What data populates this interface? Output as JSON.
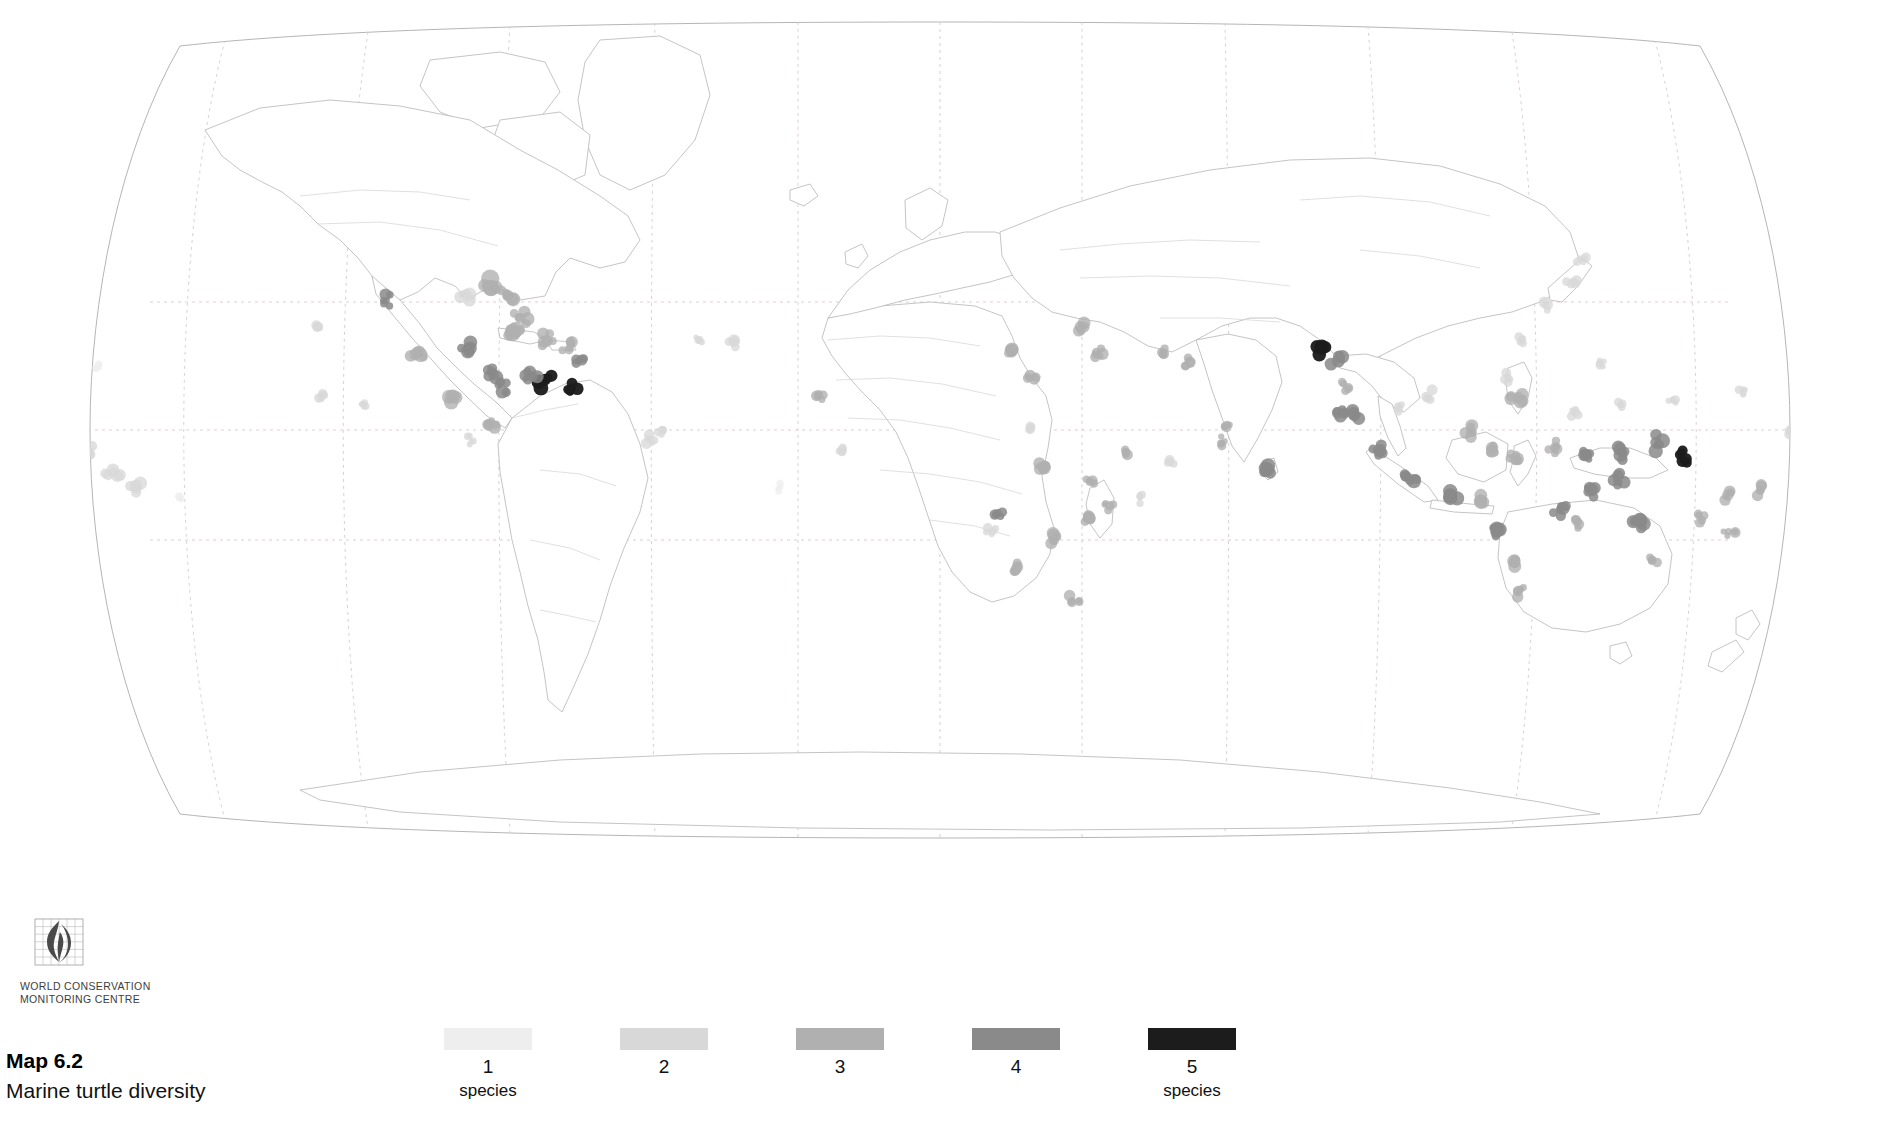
{
  "figure": {
    "caption_label": "Map 6.2",
    "caption_title": "Marine turtle diversity",
    "projection": "Robinson",
    "background_color": "#ffffff",
    "coastline_color": "#b9b9b9",
    "border_color": "#cfcfcf",
    "graticule_color": "#d9c9cf"
  },
  "logo": {
    "name": "wcmc-logo",
    "line1": "WORLD CONSERVATION",
    "line2": "MONITORING CENTRE",
    "mark_color": "#4a4a4a",
    "grid_color": "#9b9b9b"
  },
  "legend": {
    "title": "",
    "unit": "species",
    "items": [
      {
        "label": "1",
        "unit": "species",
        "color": "#eeeeee",
        "show_unit": true
      },
      {
        "label": "2",
        "unit": "species",
        "color": "#d8d8d8",
        "show_unit": false
      },
      {
        "label": "3",
        "unit": "species",
        "color": "#b0b0b0",
        "show_unit": false
      },
      {
        "label": "4",
        "unit": "species",
        "color": "#8a8a8a",
        "show_unit": false
      },
      {
        "label": "5",
        "unit": "species",
        "color": "#1c1c1c",
        "show_unit": true
      }
    ]
  },
  "chart_data": {
    "type": "map",
    "title": "Marine turtle diversity",
    "subtitle": "Map 6.2",
    "projection": "Robinson",
    "value_label": "species",
    "classes": [
      {
        "value": 1,
        "color": "#eeeeee"
      },
      {
        "value": 2,
        "color": "#d8d8d8"
      },
      {
        "value": 3,
        "color": "#b0b0b0"
      },
      {
        "value": 4,
        "color": "#8a8a8a"
      },
      {
        "value": 5,
        "color": "#1c1c1c"
      }
    ],
    "graticule": {
      "meridian_spacing_deg": 30,
      "parallels": [
        "Tropic of Cancer",
        "Equator",
        "Tropic of Capricorn"
      ],
      "style": "dotted"
    },
    "regions": [
      {
        "name": "Hawaiian Islands",
        "x": 113,
        "y": 472,
        "r": 9,
        "value": 2
      },
      {
        "name": "Hawaii-west",
        "x": 90,
        "y": 452,
        "r": 7,
        "value": 2
      },
      {
        "name": "Hawaii-east",
        "x": 135,
        "y": 487,
        "r": 8,
        "value": 2
      },
      {
        "name": "Northwest Hawaiian chain",
        "x": 97,
        "y": 368,
        "r": 5,
        "value": 1
      },
      {
        "name": "Line Islands",
        "x": 64,
        "y": 438,
        "r": 6,
        "value": 2
      },
      {
        "name": "Johnston Atoll",
        "x": 55,
        "y": 430,
        "r": 5,
        "value": 1
      },
      {
        "name": "Central Pacific atolls",
        "x": 180,
        "y": 496,
        "r": 5,
        "value": 1
      },
      {
        "name": "Baja California Pacific",
        "x": 318,
        "y": 326,
        "r": 6,
        "value": 2
      },
      {
        "name": "Gulf of California",
        "x": 385,
        "y": 300,
        "r": 8,
        "value": 4
      },
      {
        "name": "Revillagigedo",
        "x": 323,
        "y": 395,
        "r": 6,
        "value": 2
      },
      {
        "name": "Clipperton",
        "x": 362,
        "y": 404,
        "r": 5,
        "value": 2
      },
      {
        "name": "Mexican Pacific coast",
        "x": 418,
        "y": 355,
        "r": 9,
        "value": 3
      },
      {
        "name": "Central American Pacific",
        "x": 452,
        "y": 395,
        "r": 9,
        "value": 3
      },
      {
        "name": "Panama Pacific",
        "x": 495,
        "y": 425,
        "r": 8,
        "value": 3
      },
      {
        "name": "Gulf of Mexico - Texas",
        "x": 468,
        "y": 295,
        "r": 9,
        "value": 2
      },
      {
        "name": "Florida - Gulf",
        "x": 492,
        "y": 288,
        "r": 11,
        "value": 3
      },
      {
        "name": "Florida Atlantic",
        "x": 508,
        "y": 295,
        "r": 9,
        "value": 3
      },
      {
        "name": "Bahamas",
        "x": 520,
        "y": 318,
        "r": 9,
        "value": 3
      },
      {
        "name": "Cuba",
        "x": 512,
        "y": 332,
        "r": 10,
        "value": 3
      },
      {
        "name": "Yucatan / Belize",
        "x": 470,
        "y": 348,
        "r": 9,
        "value": 4
      },
      {
        "name": "Honduras / Nicaragua Caribbean",
        "x": 492,
        "y": 372,
        "r": 9,
        "value": 4
      },
      {
        "name": "Costa Rica Caribbean",
        "x": 502,
        "y": 386,
        "r": 8,
        "value": 4
      },
      {
        "name": "Hispaniola",
        "x": 545,
        "y": 340,
        "r": 9,
        "value": 3
      },
      {
        "name": "Puerto Rico / Virgin Is.",
        "x": 566,
        "y": 344,
        "r": 8,
        "value": 3
      },
      {
        "name": "Lesser Antilles",
        "x": 580,
        "y": 360,
        "r": 7,
        "value": 4
      },
      {
        "name": "Trinidad / Venezuela",
        "x": 572,
        "y": 385,
        "r": 8,
        "value": 5
      },
      {
        "name": "Guianas",
        "x": 545,
        "y": 381,
        "r": 9,
        "value": 5
      },
      {
        "name": "Colombia Caribbean",
        "x": 530,
        "y": 378,
        "r": 8,
        "value": 4
      },
      {
        "name": "Brazil northeast",
        "x": 648,
        "y": 441,
        "r": 7,
        "value": 2
      },
      {
        "name": "Fernando de Noronha",
        "x": 660,
        "y": 432,
        "r": 5,
        "value": 2
      },
      {
        "name": "Cape Verde",
        "x": 735,
        "y": 341,
        "r": 7,
        "value": 2
      },
      {
        "name": "Senegal / West Africa",
        "x": 818,
        "y": 396,
        "r": 7,
        "value": 3
      },
      {
        "name": "Guinea coast",
        "x": 843,
        "y": 452,
        "r": 6,
        "value": 2
      },
      {
        "name": "Gulf of Guinea / Bioko",
        "x": 998,
        "y": 513,
        "r": 7,
        "value": 4
      },
      {
        "name": "Sao Tome",
        "x": 991,
        "y": 530,
        "r": 6,
        "value": 2
      },
      {
        "name": "Angola / Namibia coast",
        "x": 1017,
        "y": 566,
        "r": 8,
        "value": 3
      },
      {
        "name": "South Africa east",
        "x": 1075,
        "y": 598,
        "r": 7,
        "value": 3
      },
      {
        "name": "Mozambique coast",
        "x": 1054,
        "y": 540,
        "r": 8,
        "value": 3
      },
      {
        "name": "Madagascar west",
        "x": 1089,
        "y": 520,
        "r": 8,
        "value": 3
      },
      {
        "name": "Madagascar east",
        "x": 1110,
        "y": 505,
        "r": 7,
        "value": 3
      },
      {
        "name": "Comoros / Mayotte",
        "x": 1092,
        "y": 480,
        "r": 7,
        "value": 3
      },
      {
        "name": "Seychelles",
        "x": 1126,
        "y": 455,
        "r": 7,
        "value": 3
      },
      {
        "name": "Mascarenes / Reunion",
        "x": 1140,
        "y": 498,
        "r": 6,
        "value": 2
      },
      {
        "name": "Chagos",
        "x": 1170,
        "y": 460,
        "r": 6,
        "value": 2
      },
      {
        "name": "Kenya / Tanzania",
        "x": 1045,
        "y": 466,
        "r": 8,
        "value": 3
      },
      {
        "name": "Somalia",
        "x": 1030,
        "y": 430,
        "r": 6,
        "value": 2
      },
      {
        "name": "Red Sea",
        "x": 1012,
        "y": 350,
        "r": 8,
        "value": 3
      },
      {
        "name": "Gulf of Aden",
        "x": 1030,
        "y": 378,
        "r": 7,
        "value": 3
      },
      {
        "name": "Arabian Gulf",
        "x": 1082,
        "y": 330,
        "r": 8,
        "value": 3
      },
      {
        "name": "Oman",
        "x": 1098,
        "y": 353,
        "r": 8,
        "value": 3
      },
      {
        "name": "Pakistan / NW India",
        "x": 1165,
        "y": 352,
        "r": 7,
        "value": 3
      },
      {
        "name": "Gujarat",
        "x": 1190,
        "y": 362,
        "r": 7,
        "value": 3
      },
      {
        "name": "Maldives",
        "x": 1222,
        "y": 443,
        "r": 7,
        "value": 3
      },
      {
        "name": "Lakshadweep",
        "x": 1228,
        "y": 426,
        "r": 6,
        "value": 3
      },
      {
        "name": "Sri Lanka",
        "x": 1268,
        "y": 470,
        "r": 9,
        "value": 4
      },
      {
        "name": "Andaman & Nicobar",
        "x": 1338,
        "y": 412,
        "r": 8,
        "value": 4
      },
      {
        "name": "Orissa / Bay of Bengal",
        "x": 1322,
        "y": 347,
        "r": 9,
        "value": 5
      },
      {
        "name": "Bangladesh / Myanmar",
        "x": 1337,
        "y": 360,
        "r": 8,
        "value": 4
      },
      {
        "name": "Myanmar coast",
        "x": 1345,
        "y": 385,
        "r": 7,
        "value": 3
      },
      {
        "name": "Thailand Andaman",
        "x": 1356,
        "y": 412,
        "r": 8,
        "value": 4
      },
      {
        "name": "Gulf of Thailand",
        "x": 1399,
        "y": 406,
        "r": 7,
        "value": 2
      },
      {
        "name": "Vietnam",
        "x": 1430,
        "y": 395,
        "r": 7,
        "value": 2
      },
      {
        "name": "Sumatra west",
        "x": 1380,
        "y": 452,
        "r": 9,
        "value": 4
      },
      {
        "name": "Sumatra south",
        "x": 1410,
        "y": 480,
        "r": 9,
        "value": 4
      },
      {
        "name": "Java",
        "x": 1450,
        "y": 497,
        "r": 9,
        "value": 4
      },
      {
        "name": "Bali / Lesser Sunda",
        "x": 1480,
        "y": 500,
        "r": 8,
        "value": 3
      },
      {
        "name": "Borneo north",
        "x": 1470,
        "y": 432,
        "r": 8,
        "value": 3
      },
      {
        "name": "Borneo east",
        "x": 1492,
        "y": 452,
        "r": 8,
        "value": 3
      },
      {
        "name": "Sulawesi",
        "x": 1512,
        "y": 460,
        "r": 8,
        "value": 3
      },
      {
        "name": "Philippines",
        "x": 1518,
        "y": 400,
        "r": 9,
        "value": 3
      },
      {
        "name": "Luzon",
        "x": 1510,
        "y": 378,
        "r": 7,
        "value": 2
      },
      {
        "name": "Taiwan",
        "x": 1522,
        "y": 340,
        "r": 6,
        "value": 2
      },
      {
        "name": "Ryukyu Islands",
        "x": 1545,
        "y": 305,
        "r": 7,
        "value": 2
      },
      {
        "name": "Japan south",
        "x": 1572,
        "y": 282,
        "r": 7,
        "value": 2
      },
      {
        "name": "Japan Pacific",
        "x": 1582,
        "y": 260,
        "r": 6,
        "value": 2
      },
      {
        "name": "Halmahera / Maluku",
        "x": 1556,
        "y": 448,
        "r": 8,
        "value": 3
      },
      {
        "name": "Papua west",
        "x": 1585,
        "y": 455,
        "r": 8,
        "value": 4
      },
      {
        "name": "Papua New Guinea north",
        "x": 1622,
        "y": 452,
        "r": 9,
        "value": 4
      },
      {
        "name": "Solomon Islands",
        "x": 1685,
        "y": 458,
        "r": 9,
        "value": 5
      },
      {
        "name": "Bismarck Archipelago",
        "x": 1655,
        "y": 443,
        "r": 9,
        "value": 4
      },
      {
        "name": "Papua New Guinea south",
        "x": 1618,
        "y": 480,
        "r": 8,
        "value": 4
      },
      {
        "name": "Torres Strait",
        "x": 1592,
        "y": 490,
        "r": 8,
        "value": 4
      },
      {
        "name": "Great Barrier Reef",
        "x": 1640,
        "y": 520,
        "r": 9,
        "value": 4
      },
      {
        "name": "Queensland coast",
        "x": 1652,
        "y": 560,
        "r": 7,
        "value": 3
      },
      {
        "name": "Coral Sea",
        "x": 1700,
        "y": 520,
        "r": 7,
        "value": 3
      },
      {
        "name": "New Caledonia",
        "x": 1730,
        "y": 530,
        "r": 7,
        "value": 3
      },
      {
        "name": "Vanuatu",
        "x": 1728,
        "y": 495,
        "r": 7,
        "value": 3
      },
      {
        "name": "Fiji",
        "x": 1760,
        "y": 490,
        "r": 7,
        "value": 3
      },
      {
        "name": "Tonga / Samoa",
        "x": 1800,
        "y": 478,
        "r": 6,
        "value": 2
      },
      {
        "name": "Micronesia",
        "x": 1672,
        "y": 400,
        "r": 6,
        "value": 2
      },
      {
        "name": "Marshall Islands",
        "x": 1742,
        "y": 392,
        "r": 6,
        "value": 2
      },
      {
        "name": "Caroline Islands",
        "x": 1620,
        "y": 405,
        "r": 6,
        "value": 2
      },
      {
        "name": "Palau",
        "x": 1575,
        "y": 412,
        "r": 6,
        "value": 2
      },
      {
        "name": "Mariana Islands",
        "x": 1600,
        "y": 365,
        "r": 6,
        "value": 2
      },
      {
        "name": "Kiribati / Gilbert",
        "x": 1790,
        "y": 432,
        "r": 6,
        "value": 2
      },
      {
        "name": "Northwest Australia",
        "x": 1500,
        "y": 530,
        "r": 9,
        "value": 4
      },
      {
        "name": "Western Australia",
        "x": 1515,
        "y": 560,
        "r": 8,
        "value": 3
      },
      {
        "name": "Shark Bay",
        "x": 1522,
        "y": 592,
        "r": 7,
        "value": 3
      },
      {
        "name": "Arnhem Land",
        "x": 1560,
        "y": 510,
        "r": 8,
        "value": 4
      },
      {
        "name": "Gulf of Carpentaria",
        "x": 1578,
        "y": 522,
        "r": 7,
        "value": 3
      },
      {
        "name": "Ascension / Mid-Atlantic",
        "x": 781,
        "y": 488,
        "r": 5,
        "value": 1
      },
      {
        "name": "South Atlantic island",
        "x": 700,
        "y": 340,
        "r": 6,
        "value": 2
      },
      {
        "name": "Galapagos",
        "x": 470,
        "y": 440,
        "r": 6,
        "value": 2
      }
    ]
  }
}
